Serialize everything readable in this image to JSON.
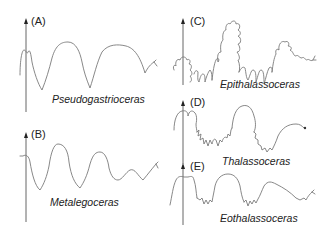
{
  "figure": {
    "panels": [
      {
        "id": "A",
        "label": "(A)",
        "taxon": "Pseudogastrioceras"
      },
      {
        "id": "B",
        "label": "(B)",
        "taxon": "Metalegoceras"
      },
      {
        "id": "C",
        "label": "(C)",
        "taxon": "Epithalassoceras"
      },
      {
        "id": "D",
        "label": "(D)",
        "taxon": "Thalassoceras"
      },
      {
        "id": "E",
        "label": "(E)",
        "taxon": "Eothalassoceras"
      }
    ],
    "colors": {
      "line": "#7a7a7a",
      "text": "#222222",
      "background": "#ffffff"
    }
  }
}
